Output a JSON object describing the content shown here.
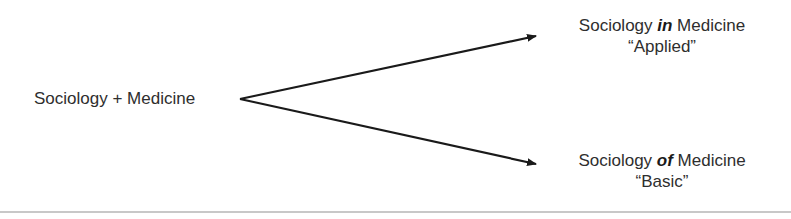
{
  "source": {
    "text": "Sociology + Medicine"
  },
  "targets": [
    {
      "prefix": "Sociology ",
      "emphasis": "in",
      "suffix": " Medicine",
      "subtitle": "“Applied”"
    },
    {
      "prefix": "Sociology ",
      "emphasis": "of",
      "suffix": " Medicine",
      "subtitle": "“Basic”"
    }
  ],
  "colors": {
    "arrow": "#1a1a1a",
    "text": "#2e2e2e"
  }
}
